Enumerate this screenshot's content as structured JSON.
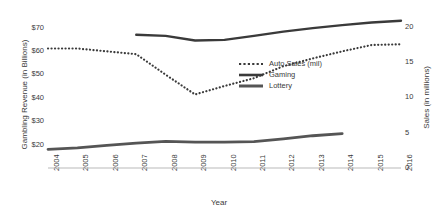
{
  "chart_data": {
    "type": "line",
    "title": "",
    "xlabel": "Year",
    "ylabel": "Gambling Revenue (in Billions)",
    "y2label": "Sales (in millions)",
    "x": [
      2004,
      2005,
      2006,
      2007,
      2008,
      2009,
      2010,
      2011,
      2012,
      2013,
      2014,
      2015,
      2016
    ],
    "xticklabels": [
      "2004",
      "2005",
      "2006",
      "2007",
      "2008",
      "2009",
      "2010",
      "2011",
      "2012",
      "2013",
      "2014",
      "2015",
      "2016"
    ],
    "ylim": [
      10,
      75
    ],
    "yticks": [
      20,
      30,
      40,
      50,
      60,
      70
    ],
    "yticklabels": [
      "$20",
      "$30",
      "$40",
      "$50",
      "$60",
      "$70"
    ],
    "y2lim": [
      0,
      21.5
    ],
    "y2ticks": [
      0,
      5,
      10,
      15,
      20
    ],
    "y2ticklabels": [
      "0",
      "5",
      "10",
      "15",
      "20"
    ],
    "grid": false,
    "legend_position": "center",
    "series": [
      {
        "name": "Auto Sales (mil)",
        "axis": "right",
        "style": "dotted",
        "color": "#3a3a3a",
        "x": [
          2004,
          2005,
          2006,
          2007,
          2008,
          2009,
          2010,
          2011,
          2012,
          2013,
          2014,
          2015,
          2016
        ],
        "values": [
          16.9,
          16.9,
          16.5,
          16.1,
          13.2,
          10.4,
          11.6,
          12.7,
          14.4,
          15.5,
          16.5,
          17.4,
          17.5
        ]
      },
      {
        "name": "Gaming",
        "axis": "left",
        "style": "solid",
        "color": "#3a3a3a",
        "x": [
          2007,
          2008,
          2009,
          2010,
          2011,
          2012,
          2013,
          2014,
          2015,
          2016
        ],
        "values": [
          67.0,
          66.5,
          64.5,
          64.8,
          66.5,
          68.3,
          69.8,
          71.1,
          72.2,
          73.0
        ]
      },
      {
        "name": "Lottery",
        "axis": "left",
        "style": "solid",
        "color": "#555555",
        "x": [
          2004,
          2005,
          2006,
          2007,
          2008,
          2009,
          2010,
          2011,
          2012,
          2013,
          2014
        ],
        "values": [
          18.0,
          18.6,
          19.7,
          20.6,
          21.4,
          21.1,
          21.1,
          21.3,
          22.5,
          23.8,
          24.7
        ]
      }
    ]
  }
}
